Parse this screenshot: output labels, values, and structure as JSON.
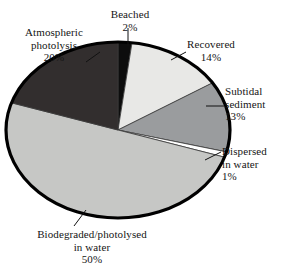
{
  "figure": {
    "background_color": "#ffffff",
    "rim_color": "#000000"
  },
  "chart_data": {
    "type": "pie",
    "title": "",
    "xlabel": "",
    "ylabel": "",
    "legend_position": "none",
    "grid": false,
    "labels_show_percent": true,
    "total_percent": 100,
    "start_angle_deg": 0,
    "direction": "clockwise",
    "categories": [
      "Beached",
      "Recovered",
      "Subtidal sediment",
      "Dispersed in water",
      "Biodegraded/photolysed in water",
      "Atmospheric photolysis"
    ],
    "values": [
      2,
      14,
      13,
      1,
      50,
      20
    ],
    "slices": [
      {
        "name": "Beached",
        "label_lines": [
          "Beached",
          "2%"
        ],
        "value": 2,
        "percent_text": "2%",
        "color": "#0d0d0d",
        "start_deg": 0,
        "end_deg": 7.2
      },
      {
        "name": "Recovered",
        "label_lines": [
          "Recovered",
          "14%"
        ],
        "value": 14,
        "percent_text": "14%",
        "color": "#e8e8e6",
        "start_deg": 7.2,
        "end_deg": 57.6
      },
      {
        "name": "Subtidal sediment",
        "label_lines": [
          "Subtidal",
          "sediment",
          "13%"
        ],
        "value": 13,
        "percent_text": "13%",
        "color": "#9a9c9e",
        "start_deg": 57.6,
        "end_deg": 104.4
      },
      {
        "name": "Dispersed in water",
        "label_lines": [
          "Dispersed",
          "in water",
          "1%"
        ],
        "value": 1,
        "percent_text": "1%",
        "color": "#ffffff",
        "start_deg": 104.4,
        "end_deg": 108.0
      },
      {
        "name": "Biodegraded/photolysed in water",
        "label_lines": [
          "Biodegraded/photolysed",
          "in water",
          "50%"
        ],
        "value": 50,
        "percent_text": "50%",
        "color": "#c6c7c5",
        "start_deg": 108.0,
        "end_deg": 288.0
      },
      {
        "name": "Atmospheric photolysis",
        "label_lines": [
          "Atmospheric",
          "photolysis",
          "20%"
        ],
        "value": 20,
        "percent_text": "20%",
        "color": "#322e2e",
        "start_deg": 288.0,
        "end_deg": 360.0
      }
    ]
  }
}
